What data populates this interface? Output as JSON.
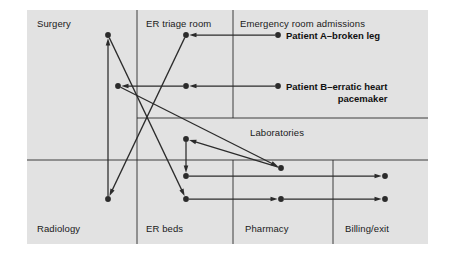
{
  "diagram": {
    "background_color": "#e2e2e2",
    "line_color": "#2b2b2b",
    "frame": {
      "x": 27,
      "y": 10,
      "width": 401,
      "height": 234
    },
    "zones": [
      {
        "id": "surgery",
        "label": "Surgery",
        "x": 37,
        "y": 18
      },
      {
        "id": "er-triage",
        "label": "ER triage room",
        "x": 146,
        "y": 18
      },
      {
        "id": "er-admit",
        "label": "Emergency room admissions",
        "x": 240,
        "y": 18
      },
      {
        "id": "labs",
        "label": "Laboratories",
        "x": 250,
        "y": 127
      },
      {
        "id": "radiology",
        "label": "Radiology",
        "x": 37,
        "y": 223
      },
      {
        "id": "er-beds",
        "label": "ER beds",
        "x": 146,
        "y": 223
      },
      {
        "id": "pharmacy",
        "label": "Pharmacy",
        "x": 245,
        "y": 223
      },
      {
        "id": "billing",
        "label": "Billing/exit",
        "x": 345,
        "y": 223
      }
    ],
    "patients": [
      {
        "id": "patient-a",
        "label": "Patient A–broken leg",
        "x": 286,
        "y": 30
      },
      {
        "id": "patient-b",
        "label": "Patient B–erratic heart\npacemaker",
        "x": 286,
        "y": 81
      }
    ],
    "dividers": {
      "vertical": [
        {
          "x": 137,
          "y1": 10,
          "y2": 244
        },
        {
          "x": 233,
          "y1": 10,
          "y2": 118
        },
        {
          "x": 233,
          "y1": 160,
          "y2": 244
        },
        {
          "x": 333,
          "y1": 160,
          "y2": 244
        }
      ],
      "horizontal": [
        {
          "y": 118,
          "x1": 137,
          "x2": 428
        },
        {
          "y": 160,
          "x1": 27,
          "x2": 428
        }
      ]
    },
    "nodes": [
      {
        "id": "n-surgery-top",
        "x": 108,
        "y": 35,
        "zone": "surgery"
      },
      {
        "id": "n-surgery-mid",
        "x": 118,
        "y": 86,
        "zone": "surgery"
      },
      {
        "id": "n-radiology",
        "x": 108,
        "y": 199,
        "zone": "radiology"
      },
      {
        "id": "n-triage-top",
        "x": 186,
        "y": 35,
        "zone": "er-triage"
      },
      {
        "id": "n-triage-mid",
        "x": 186,
        "y": 86,
        "zone": "er-triage"
      },
      {
        "id": "n-bed-top",
        "x": 186,
        "y": 139,
        "zone": "er-beds"
      },
      {
        "id": "n-bed-mid",
        "x": 186,
        "y": 176,
        "zone": "er-beds"
      },
      {
        "id": "n-bed-bottom",
        "x": 186,
        "y": 199,
        "zone": "er-beds"
      },
      {
        "id": "n-admit-a",
        "x": 278,
        "y": 35,
        "zone": "er-admit"
      },
      {
        "id": "n-admit-b",
        "x": 278,
        "y": 86,
        "zone": "er-admit"
      },
      {
        "id": "n-lab",
        "x": 281,
        "y": 168,
        "zone": "labs"
      },
      {
        "id": "n-pharmacy",
        "x": 281,
        "y": 199,
        "zone": "pharmacy"
      },
      {
        "id": "n-billing-upper",
        "x": 385,
        "y": 176,
        "zone": "billing"
      },
      {
        "id": "n-billing-lower",
        "x": 385,
        "y": 199,
        "zone": "billing"
      }
    ],
    "edges": [
      {
        "id": "e-admitA-to-triage",
        "from": "n-admit-a",
        "to": "n-triage-top",
        "arrow": "end"
      },
      {
        "id": "e-triage-to-radiology",
        "from": "n-triage-top",
        "to": "n-radiology",
        "arrow": "end"
      },
      {
        "id": "e-radiology-to-surgery",
        "from": "n-radiology",
        "to": "n-surgery-top",
        "arrow": "end"
      },
      {
        "id": "e-surgery-to-bed",
        "from": "n-surgery-top",
        "to": "n-bed-bottom",
        "arrow": "end"
      },
      {
        "id": "e-admitB-to-triage",
        "from": "n-admit-b",
        "to": "n-triage-mid",
        "arrow": "end"
      },
      {
        "id": "e-triageB-to-surgerymid",
        "from": "n-triage-mid",
        "to": "n-surgery-mid",
        "arrow": "end"
      },
      {
        "id": "e-surgerymid-to-lab",
        "from": "n-surgery-mid",
        "to": "n-lab",
        "arrow": "end"
      },
      {
        "id": "e-lab-to-bedtop",
        "from": "n-lab",
        "to": "n-bed-top",
        "arrow": "end"
      },
      {
        "id": "e-bedtop-to-bedmid",
        "from": "n-bed-top",
        "to": "n-bed-mid",
        "arrow": "end"
      },
      {
        "id": "e-bedmid-to-billing",
        "from": "n-bed-mid",
        "to": "n-billing-upper",
        "arrow": "end"
      },
      {
        "id": "e-bedbottom-to-pharmacy",
        "from": "n-bed-bottom",
        "to": "n-pharmacy",
        "arrow": "end"
      },
      {
        "id": "e-pharmacy-to-billing",
        "from": "n-pharmacy",
        "to": "n-billing-lower",
        "arrow": "end"
      }
    ]
  }
}
